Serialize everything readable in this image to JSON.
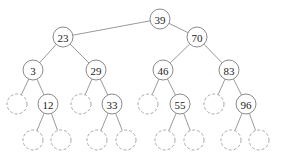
{
  "diagram": {
    "type": "binary-search-tree",
    "node_radius": 10,
    "nodes": [
      {
        "id": "n39",
        "label": "39",
        "x": 160,
        "y": 19,
        "kind": "key"
      },
      {
        "id": "n23",
        "label": "23",
        "x": 63,
        "y": 37,
        "kind": "key"
      },
      {
        "id": "n70",
        "label": "70",
        "x": 197,
        "y": 37,
        "kind": "key"
      },
      {
        "id": "n3",
        "label": "3",
        "x": 33,
        "y": 70,
        "kind": "key"
      },
      {
        "id": "n29",
        "label": "29",
        "x": 96,
        "y": 70,
        "kind": "key"
      },
      {
        "id": "n46",
        "label": "46",
        "x": 163,
        "y": 70,
        "kind": "key"
      },
      {
        "id": "n83",
        "label": "83",
        "x": 229,
        "y": 70,
        "kind": "key"
      },
      {
        "id": "e3L",
        "label": "",
        "x": 17,
        "y": 104,
        "kind": "nil"
      },
      {
        "id": "n12",
        "label": "12",
        "x": 48,
        "y": 104,
        "kind": "key"
      },
      {
        "id": "e29L",
        "label": "",
        "x": 81,
        "y": 104,
        "kind": "nil"
      },
      {
        "id": "n33",
        "label": "33",
        "x": 112,
        "y": 104,
        "kind": "key"
      },
      {
        "id": "e46L",
        "label": "",
        "x": 148,
        "y": 104,
        "kind": "nil"
      },
      {
        "id": "n55",
        "label": "55",
        "x": 180,
        "y": 104,
        "kind": "key"
      },
      {
        "id": "e83L",
        "label": "",
        "x": 214,
        "y": 104,
        "kind": "nil"
      },
      {
        "id": "n96",
        "label": "96",
        "x": 246,
        "y": 104,
        "kind": "key"
      },
      {
        "id": "e12L",
        "label": "",
        "x": 33,
        "y": 140,
        "kind": "nil"
      },
      {
        "id": "e12R",
        "label": "",
        "x": 61,
        "y": 140,
        "kind": "nil"
      },
      {
        "id": "e33L",
        "label": "",
        "x": 97,
        "y": 140,
        "kind": "nil"
      },
      {
        "id": "e33R",
        "label": "",
        "x": 126,
        "y": 140,
        "kind": "nil"
      },
      {
        "id": "e55L",
        "label": "",
        "x": 165,
        "y": 140,
        "kind": "nil"
      },
      {
        "id": "e55R",
        "label": "",
        "x": 194,
        "y": 140,
        "kind": "nil"
      },
      {
        "id": "e96L",
        "label": "",
        "x": 231,
        "y": 140,
        "kind": "nil"
      },
      {
        "id": "e96R",
        "label": "",
        "x": 259,
        "y": 140,
        "kind": "nil"
      }
    ],
    "edges": [
      [
        "n39",
        "n23"
      ],
      [
        "n39",
        "n70"
      ],
      [
        "n23",
        "n3"
      ],
      [
        "n23",
        "n29"
      ],
      [
        "n70",
        "n46"
      ],
      [
        "n70",
        "n83"
      ],
      [
        "n3",
        "e3L"
      ],
      [
        "n3",
        "n12"
      ],
      [
        "n29",
        "e29L"
      ],
      [
        "n29",
        "n33"
      ],
      [
        "n46",
        "e46L"
      ],
      [
        "n46",
        "n55"
      ],
      [
        "n83",
        "e83L"
      ],
      [
        "n83",
        "n96"
      ],
      [
        "n12",
        "e12L"
      ],
      [
        "n12",
        "e12R"
      ],
      [
        "n33",
        "e33L"
      ],
      [
        "n33",
        "e33R"
      ],
      [
        "n55",
        "e55L"
      ],
      [
        "n55",
        "e55R"
      ],
      [
        "n96",
        "e96L"
      ],
      [
        "n96",
        "e96R"
      ]
    ]
  }
}
